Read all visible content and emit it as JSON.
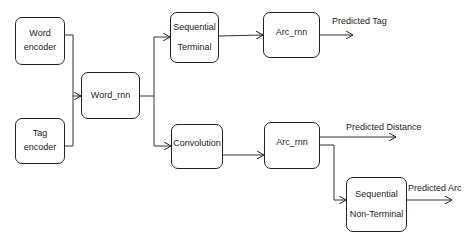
{
  "diagram": {
    "nodes": {
      "word_encoder": {
        "line1": "Word",
        "line2": "encoder"
      },
      "tag_encoder": {
        "line1": "Tag",
        "line2": "encoder"
      },
      "word_rnn": {
        "label": "Word_rnn"
      },
      "seq_terminal": {
        "line1": "Sequential",
        "line2": "Terminal"
      },
      "convolution": {
        "label": "Convolution"
      },
      "arc_rnn_top": {
        "label": "Arc_rnn"
      },
      "arc_rnn_bottom": {
        "label": "Arc_rnn"
      },
      "seq_nonterminal": {
        "line1": "Sequential",
        "line2": "Non-Terminal"
      }
    },
    "outputs": {
      "predicted_tag": "Predicted Tag",
      "predicted_distance": "Predicted Distance",
      "predicted_arc": "Predicted Arc"
    },
    "edges": [
      {
        "from": "Word encoder",
        "to": "Word_rnn"
      },
      {
        "from": "Tag encoder",
        "to": "Word_rnn"
      },
      {
        "from": "Word_rnn",
        "to": "Sequential Terminal"
      },
      {
        "from": "Word_rnn",
        "to": "Convolution"
      },
      {
        "from": "Sequential Terminal",
        "to": "Arc_rnn (top)"
      },
      {
        "from": "Convolution",
        "to": "Arc_rnn (bottom)"
      },
      {
        "from": "Arc_rnn (top)",
        "to": "Predicted Tag"
      },
      {
        "from": "Arc_rnn (bottom)",
        "to": "Predicted Distance"
      },
      {
        "from": "Arc_rnn (bottom)",
        "to": "Sequential Non-Terminal"
      },
      {
        "from": "Sequential Non-Terminal",
        "to": "Predicted Arc"
      }
    ],
    "colors": {
      "stroke": "#222222",
      "background": "#ffffff"
    }
  }
}
